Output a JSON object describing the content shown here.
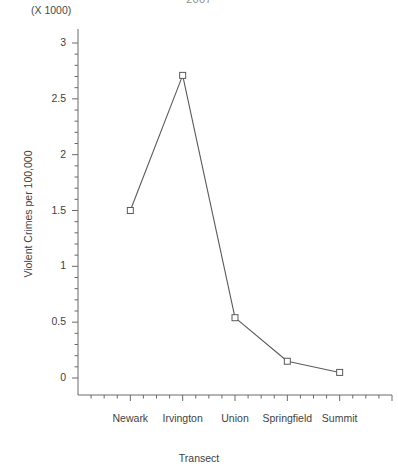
{
  "chart_data": {
    "type": "line",
    "title": "2007",
    "multiplier_note": "(X 1000)",
    "xlabel": "Transect",
    "ylabel": "Violent Crimes per 100,000",
    "categories": [
      "Newark",
      "Irvington",
      "Union",
      "Springfield",
      "Summit"
    ],
    "values": [
      1.5,
      2.71,
      0.54,
      0.15,
      0.05
    ],
    "series": [
      {
        "name": "Violent Crimes per 100,000",
        "values": [
          1.5,
          2.71,
          0.54,
          0.15,
          0.05
        ]
      }
    ],
    "ylim": [
      0,
      3
    ],
    "xlim": [
      0,
      6
    ],
    "ytick_labels": [
      "0",
      "0.5",
      "1",
      "1.5",
      "2",
      "2.5",
      "3"
    ],
    "ytick_values": [
      0,
      0.5,
      1,
      1.5,
      2,
      2.5,
      3
    ],
    "y_minor_tick_count_between": 4,
    "grid": false,
    "legend": false,
    "legend_position": "none",
    "marker": "open-square",
    "line_color": "#5a5a5a",
    "marker_color": "#5a5a5a",
    "axis_color": "#6a6a6a",
    "background_color": "#ffffff"
  }
}
